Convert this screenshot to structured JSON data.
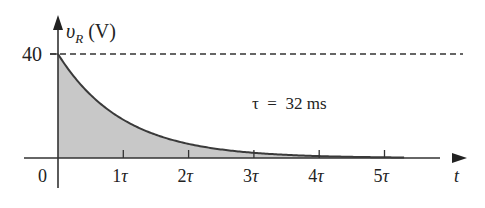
{
  "chart_data": {
    "type": "area",
    "title": "",
    "ylabel_symbol": "v",
    "ylabel_subscript": "R",
    "ylabel_unit": "(V)",
    "xlabel": "t",
    "y_tick_label": "40",
    "x_origin_label": "0",
    "x_tick_labels": [
      "1τ",
      "2τ",
      "3τ",
      "4τ",
      "5τ"
    ],
    "annotation": "τ = 32 ms",
    "tau_ms": 32,
    "function": "v_R = 40 e^(-t/τ)",
    "x": [
      0,
      1,
      2,
      3,
      4,
      5
    ],
    "values": [
      40,
      14.72,
      5.41,
      1.99,
      0.73,
      0.27
    ],
    "ylim": [
      0,
      40
    ],
    "xlim": [
      0,
      5
    ],
    "asymptote_dashed_at": 40,
    "fill_color": "#c8c8c8",
    "line_color": "#3a3a3a",
    "grid": false
  },
  "labels": {
    "y_symbol": "υ",
    "y_sub": "R",
    "y_unit": " (V)",
    "y_40": "40",
    "x_0": "0",
    "x_t": "t",
    "tau_eq": "τ  =  32 ms",
    "ticks": [
      "1",
      "2",
      "3",
      "4",
      "5"
    ],
    "tau": "τ"
  }
}
